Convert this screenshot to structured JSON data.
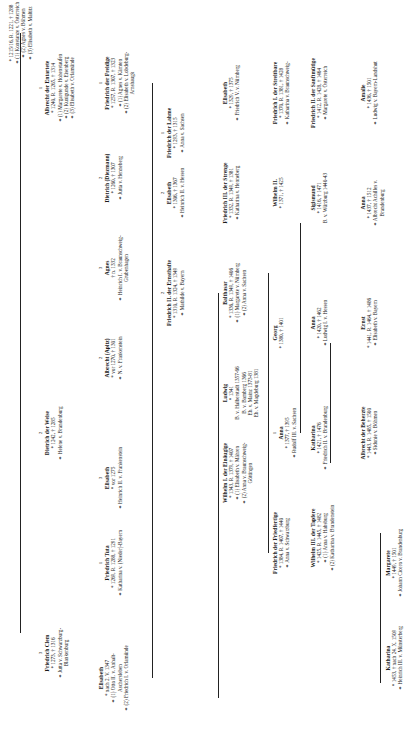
{
  "marriage_symbol": "⚭",
  "nodes": [
    {
      "id": "n0",
      "num": "",
      "name": "",
      "lines": [
        "* 1215/16, R. 1221, † 1288",
        "⚭ (1) Konstanze v. Österreich",
        "⚭ (2) Agnes v. Böhmen",
        "⚭ (3) Elisabeth v. Maltitz"
      ]
    },
    {
      "id": "n1",
      "num": "1",
      "name": "Albrecht der Entartete",
      "lines": [
        "* 1240, R. 1265, † 1314",
        "⚭ (1) Margarete v. Hohenstaufen",
        "⚭ (2) Kunigunde v. Eisenberg",
        "⚭ (3) Elisabeth v. Orlamünde"
      ]
    },
    {
      "id": "n2",
      "num": "2",
      "name": "Dietrich der Weise",
      "lines": [
        "* 1242, † 1285",
        "⚭ Helene v. Brandenburg"
      ]
    },
    {
      "id": "n3",
      "num": "3",
      "name": "Friedrich Clem",
      "lines": [
        "* 1273, † 1316",
        "⚭ Jutta v. Schwarzburg-",
        "Blankenburg"
      ]
    },
    {
      "id": "n4",
      "num": "1",
      "name": "Friedrich der Freidige",
      "lines": [
        "* 1257, R. 1307, † 1323",
        "⚭ (1) Agnes v. Kärnten",
        "⚭ (2) Elisabeth v. Lobdeburg-",
        "Arnshaugk"
      ]
    },
    {
      "id": "n5",
      "num": "2",
      "name": "Dietrich (Diezmann)",
      "lines": [
        "* 1260, † 1307",
        "⚭ Jutta v. Henneberg"
      ]
    },
    {
      "id": "n6",
      "num": "3",
      "name": "Agnes",
      "lines": [
        "† n. 1332",
        "⚭ Heinrich I. v. Braunschweig-",
        "Grubenhagen"
      ]
    },
    {
      "id": "n7",
      "num": "2",
      "name": "Albrecht (Apitz)",
      "lines": [
        "* vor 1270, † 1301",
        "⚭ N. v. Frankenstein"
      ]
    },
    {
      "id": "n8",
      "num": "3",
      "name": "Elisabeth",
      "lines": [
        "* vor 1275",
        "⚭ Heinrich II. v. Frankenstein"
      ]
    },
    {
      "id": "n9",
      "num": "1",
      "name": "Friedrich Tuta",
      "lines": [
        "* 1269, R. 1288, † 1291",
        "⚭ Katharina v. (Nieder)-Bayern"
      ]
    },
    {
      "id": "n10",
      "num": "",
      "name": "Elisabeth",
      "lines": [
        "* nach 2. V. 1347",
        "⚭ (1) Otto II. v. Anhalt-",
        "Aschersleben",
        "⚭ (2) Friedrich I. v. Orlamünde"
      ]
    },
    {
      "id": "n11",
      "num": "1",
      "name": "Friedrich der Lahme",
      "lines": [
        "* 1293, † 1315",
        "⚭ Anna v. Sachsen"
      ]
    },
    {
      "id": "n12",
      "num": "2",
      "name": "Elisabeth",
      "lines": [
        "* 1306, † 1367",
        "⚭ Heinrich II. v. Hessen"
      ]
    },
    {
      "id": "n13",
      "num": "2",
      "name": "Friedrich II. der Ernsthafte",
      "lines": [
        "* 1310, R. 1324, † 1349",
        "⚭ Mathilde v. Bayern"
      ]
    },
    {
      "id": "n14",
      "num": "",
      "name": "Elisabeth",
      "lines": [
        "* 1329, † 1375",
        "⚭ Friedrich V. v. Nürnberg"
      ]
    },
    {
      "id": "n15",
      "num": "",
      "name": "Friedrich III. der Strenge",
      "lines": [
        "* 1332, R. 1349, † 1381",
        "⚭ Katharina v. Henneberg"
      ]
    },
    {
      "id": "n16",
      "num": "",
      "name": "Balthasar",
      "lines": [
        "* 1336, R. 1349, † 1406",
        "⚭ (1) Margarete v. Nürnberg",
        "⚭ (2) Anna v. Sachsen"
      ]
    },
    {
      "id": "n17",
      "num": "",
      "name": "Ludwig",
      "lines": [
        "* 1341",
        "B. v. Halberstadt 1357-66",
        "B. v. Bamberg 1366",
        "Eb. v. Mainz 1373-81",
        "Eb. v. Magdeburg 1381"
      ]
    },
    {
      "id": "n18",
      "num": "",
      "name": "Wilhelm I. der Einäugige",
      "lines": [
        "* 1343, R. 1379, † 1407",
        "⚭ (1) Elisabeth v. Mähren",
        "⚭ (2) Anna v. Braunschweig-",
        "Göttingen"
      ]
    },
    {
      "id": "n19",
      "num": "",
      "name": "Friedrich I. der Streitbare",
      "lines": [
        "* 1370, R. 1381, † 1428",
        "⚭ Katharina v. Braunschweig-",
        "Lüneburg"
      ]
    },
    {
      "id": "n20",
      "num": "",
      "name": "Wilhelm II.",
      "lines": [
        "* 1371, † 1425"
      ]
    },
    {
      "id": "n21",
      "num": "",
      "name": "Georg",
      "lines": [
        "* 1380, † 1401"
      ]
    },
    {
      "id": "n22",
      "num": "1",
      "name": "Anna",
      "lines": [
        "* 1377, † 1395",
        "⚭ Rudolf III. v. Sachsen"
      ]
    },
    {
      "id": "n23",
      "num": "",
      "name": "Friedrich der Friedfertige",
      "lines": [
        "* 1384, R. 1407, † 1440",
        "⚭ Anna v. Schwarzburg"
      ]
    },
    {
      "id": "n24",
      "num": "",
      "name": "Friedrich II. der Sanftmütige",
      "lines": [
        "* 1412, R. 1428, † 1464",
        "⚭ Margarete v. Österreich"
      ]
    },
    {
      "id": "n25",
      "num": "",
      "name": "Sigismund",
      "lines": [
        "* 1416, † 1471",
        "B. v. Würzburg 1440-43"
      ]
    },
    {
      "id": "n26",
      "num": "",
      "name": "Anna",
      "lines": [
        "* 1420, † 1462",
        "⚭ Ludwig I. v. Hessen"
      ]
    },
    {
      "id": "n27",
      "num": "",
      "name": "Katharina",
      "lines": [
        "* 1421, † 1476",
        "⚭ Friedrich II. v. Brandenburg"
      ]
    },
    {
      "id": "n28",
      "num": "",
      "name": "Wilhelm III. der Tapfere",
      "lines": [
        "* 1425, R. 1445, † 1482",
        "⚭ (1) Anna v. Habsburg",
        "⚭ (2) Katharina v. Brandenstein"
      ]
    },
    {
      "id": "n29",
      "num": "",
      "name": "Amalie",
      "lines": [
        "* 1436, † 1501",
        "⚭ Ludwig v. Bayern-Landshut"
      ]
    },
    {
      "id": "n30",
      "num": "",
      "name": "Anna",
      "lines": [
        "* 1437, † 1512",
        "⚭ Albrecht Achilles v.",
        "Brandenburg"
      ]
    },
    {
      "id": "n31",
      "num": "",
      "name": "Ernst",
      "lines": [
        "* 1441, R. 1464, † 1486",
        "⚭ Elisabeth v. Bayern"
      ]
    },
    {
      "id": "n32",
      "num": "",
      "name": "Albrecht der Beherzte",
      "lines": [
        "* 1443, R. 1485, † 1500",
        "⚭ Sidonie v. Böhmen"
      ]
    },
    {
      "id": "n33",
      "num": "",
      "name": "Margarete",
      "lines": [
        "* 1449, † 1501",
        "⚭ Johann Cicero v. Brandenburg"
      ]
    },
    {
      "id": "n34",
      "num": "",
      "name": "Katharina",
      "lines": [
        "* 1453, † nach 24. X. 1509",
        "⚭ Heinrich III. v. Münsterberg"
      ]
    }
  ]
}
